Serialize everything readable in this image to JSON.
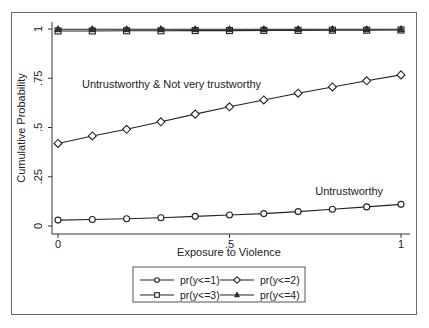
{
  "chart_data": {
    "type": "line",
    "title": "",
    "xlabel": "Exposure to Violence",
    "ylabel": "Cumulative Probability",
    "xlim": [
      0,
      1
    ],
    "ylim": [
      0,
      1
    ],
    "x_ticks": [
      "0",
      ".5",
      "1"
    ],
    "y_ticks": [
      "0",
      ".25",
      ".5",
      ".75",
      "1"
    ],
    "grid": false,
    "legend_position": "bottom",
    "x": [
      0,
      0.1,
      0.2,
      0.3,
      0.4,
      0.5,
      0.6,
      0.7,
      0.8,
      0.9,
      1.0
    ],
    "series": [
      {
        "name": "pr(y<=1)",
        "marker": "circle",
        "values": [
          0.03,
          0.033,
          0.037,
          0.042,
          0.049,
          0.056,
          0.063,
          0.073,
          0.085,
          0.097,
          0.11
        ]
      },
      {
        "name": "pr(y<=2)",
        "marker": "diamond",
        "values": [
          0.419,
          0.457,
          0.491,
          0.529,
          0.568,
          0.605,
          0.64,
          0.674,
          0.706,
          0.737,
          0.767
        ]
      },
      {
        "name": "pr(y<=3)",
        "marker": "square",
        "values": [
          0.99,
          0.99,
          0.991,
          0.991,
          0.992,
          0.992,
          0.993,
          0.993,
          0.994,
          0.994,
          0.995
        ]
      },
      {
        "name": "pr(y<=4)",
        "marker": "triangle",
        "values": [
          0.999,
          0.999,
          0.999,
          0.999,
          0.999,
          0.999,
          0.999,
          0.999,
          0.999,
          0.999,
          0.999
        ]
      }
    ],
    "annotations": [
      {
        "text": "Untrustworthy & Not very trustworthy",
        "x": 0.07,
        "y": 0.7
      },
      {
        "text": "Untrustworthy",
        "x": 0.75,
        "y": 0.155
      }
    ]
  },
  "legend": {
    "items": [
      {
        "label": "pr(y<=1)"
      },
      {
        "label": "pr(y<=2)"
      },
      {
        "label": "pr(y<=3)"
      },
      {
        "label": "pr(y<=4)"
      }
    ]
  }
}
